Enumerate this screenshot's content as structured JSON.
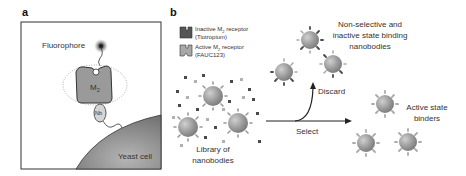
{
  "figure": {
    "panel_a": {
      "letter": "a",
      "fluorophore_label": "Fluorophore",
      "receptor_label": "M",
      "receptor_sub": "2",
      "nanobody_label": "Nb",
      "cell_label": "Yeast cell"
    },
    "panel_b": {
      "letter": "b",
      "legend": [
        {
          "line1_pre": "Inactive M",
          "sub": "2",
          "line1_post": " receptor",
          "line2": "(Tiotropium)",
          "color": "#555555"
        },
        {
          "line1_pre": "Active M",
          "sub": "2",
          "line1_post": " receptor",
          "line2": "(FAUC123)",
          "color": "#a8a8a8"
        }
      ],
      "library_label_1": "Library of",
      "library_label_2": "nanobodies",
      "discard_label": "Discard",
      "select_label": "Select",
      "discard_group_1": "Non-selective and",
      "discard_group_2": "inactive state binding",
      "discard_group_3": "nanobodies",
      "active_label_1": "Active state",
      "active_label_2": "binders"
    },
    "colors": {
      "outline": "#333333",
      "receptor_fill": "#9a9a9a",
      "cell_fill": "#8a8a8a",
      "dark_dot": "#4a4a4a",
      "light_dot": "#b0b0b0"
    }
  }
}
